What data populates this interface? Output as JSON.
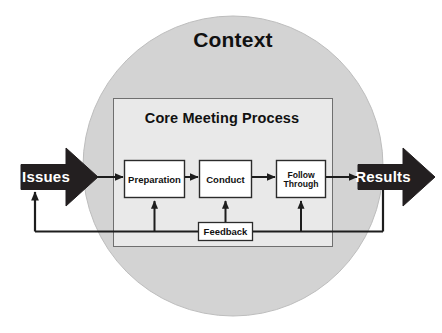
{
  "diagram": {
    "title": "Context",
    "inner_panel_title": "Core Meeting Process",
    "input": {
      "label": "Issues"
    },
    "output": {
      "label": "Results"
    },
    "steps": [
      {
        "id": "preparation",
        "label": "Preparation",
        "line1": "Preparation",
        "line2": ""
      },
      {
        "id": "conduct",
        "label": "Conduct",
        "line1": "Conduct",
        "line2": ""
      },
      {
        "id": "follow-through",
        "label": "Follow Through",
        "line1": "Follow",
        "line2": "Through"
      }
    ],
    "feedback": {
      "label": "Feedback"
    },
    "colors": {
      "context_circle_fill": "#d3d3d3",
      "context_circle_stroke": "#b6b6b6",
      "inner_panel_fill": "#e9e9e9",
      "inner_panel_stroke": "#6f6f6f",
      "step_box_fill": "#ffffff",
      "step_box_stroke": "#2b2b2b",
      "block_arrow_fill": "#231f20",
      "connector_stroke": "#1d1d1d",
      "label_text": "#111111",
      "block_arrow_text": "#ffffff",
      "page_background": "#ffffff"
    }
  }
}
